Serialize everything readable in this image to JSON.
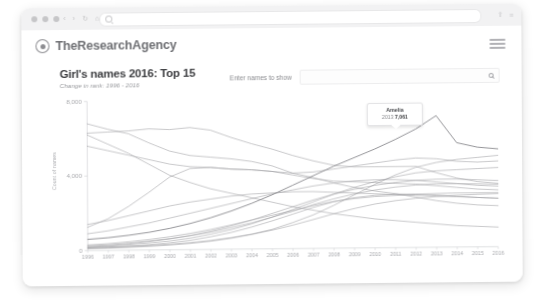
{
  "browser": {
    "traffic_lights": [
      "close",
      "minimize",
      "maximize"
    ],
    "nav": {
      "back": "‹",
      "forward": "›",
      "reload": "↻",
      "home": "⌂"
    },
    "url_value": "",
    "right_icons": [
      "share-icon",
      "menu-icon"
    ]
  },
  "site": {
    "brand_name": "TheResearchAgency",
    "menu_label": "Menu"
  },
  "chart_header": {
    "title": "Girl's names 2016: Top 15",
    "subtitle": "Change in rank: 1996 - 2016"
  },
  "search": {
    "label": "Enter names to show",
    "placeholder": "",
    "value": ""
  },
  "tooltip": {
    "name": "Amelia",
    "year": "2013",
    "value": "7,061"
  },
  "colors": {
    "line": "#9a9b9f",
    "line_highlight": "#7c7d81",
    "axis": "#d3d4d6",
    "tick_text": "#a9aaae",
    "title": "#3e3f42",
    "brand": "#6f7074"
  },
  "chart_data": {
    "type": "line",
    "title": "Girl's names 2016: Top 15",
    "subtitle": "Change in rank: 1996 - 2016",
    "xlabel": "",
    "ylabel": "Count of names",
    "xlim": [
      1996,
      2016
    ],
    "ylim": [
      0,
      8000
    ],
    "yticks": [
      0,
      4000,
      8000
    ],
    "yticklabels": [
      "0",
      "4,000",
      "8,000"
    ],
    "x": [
      1996,
      1997,
      1998,
      1999,
      2000,
      2001,
      2002,
      2003,
      2004,
      2005,
      2006,
      2007,
      2008,
      2009,
      2010,
      2011,
      2012,
      2013,
      2014,
      2015,
      2016
    ],
    "grid": false,
    "legend": "none",
    "annotation": {
      "series": "Amelia",
      "x": 2013,
      "y": 7061,
      "label": "Amelia 2013 7,061"
    },
    "series": [
      {
        "name": "Chloe",
        "values": [
          6800,
          6500,
          6250,
          5750,
          5300,
          5050,
          4950,
          4850,
          4700,
          4450,
          4050,
          3800,
          3500,
          3250,
          3050,
          2900,
          2700,
          2500,
          2350,
          2250,
          2200
        ]
      },
      {
        "name": "Emily",
        "values": [
          6300,
          6350,
          6400,
          6500,
          6450,
          6550,
          6400,
          6000,
          5650,
          5350,
          5000,
          4700,
          4450,
          4350,
          4350,
          4350,
          4350,
          4000,
          3700,
          3500,
          3400
        ]
      },
      {
        "name": "Jessica",
        "values": [
          6200,
          5700,
          5200,
          4600,
          4000,
          3600,
          3250,
          3000,
          2750,
          2500,
          2250,
          2050,
          1850,
          1700,
          1550,
          1450,
          1350,
          1250,
          1150,
          1100,
          1050
        ]
      },
      {
        "name": "Sophie",
        "values": [
          5600,
          5350,
          5100,
          4850,
          4600,
          4450,
          4400,
          4300,
          4250,
          4150,
          3950,
          3750,
          3600,
          3550,
          3500,
          3450,
          3400,
          3300,
          3200,
          3100,
          3050
        ]
      },
      {
        "name": "Olivia",
        "values": [
          1250,
          1700,
          2350,
          3100,
          3900,
          4350,
          4400,
          4300,
          4250,
          4150,
          4050,
          4100,
          4250,
          4400,
          4550,
          4700,
          4800,
          4750,
          4600,
          4550,
          4600
        ]
      },
      {
        "name": "Amelia",
        "values": [
          600,
          680,
          800,
          950,
          1150,
          1400,
          1700,
          2050,
          2450,
          2900,
          3400,
          3900,
          4400,
          4850,
          5300,
          5800,
          6350,
          7061,
          5600,
          5350,
          5250
        ]
      },
      {
        "name": "Isla",
        "values": [
          150,
          170,
          200,
          240,
          300,
          380,
          480,
          620,
          800,
          1050,
          1400,
          1800,
          2300,
          2850,
          3400,
          3900,
          4300,
          4550,
          4700,
          4800,
          4900
        ]
      },
      {
        "name": "Ava",
        "values": [
          180,
          220,
          280,
          360,
          470,
          620,
          820,
          1050,
          1350,
          1700,
          2100,
          2500,
          2900,
          3250,
          3550,
          3800,
          4000,
          4100,
          4150,
          4200,
          4250
        ]
      },
      {
        "name": "Poppy",
        "values": [
          200,
          250,
          330,
          440,
          580,
          760,
          980,
          1250,
          1550,
          1900,
          2250,
          2600,
          2900,
          3150,
          3350,
          3500,
          3600,
          3650,
          3650,
          3600,
          3550
        ]
      },
      {
        "name": "Lily",
        "values": [
          900,
          1050,
          1250,
          1450,
          1700,
          1950,
          2200,
          2450,
          2700,
          2950,
          3150,
          3350,
          3500,
          3600,
          3650,
          3650,
          3600,
          3500,
          3400,
          3300,
          3250
        ]
      },
      {
        "name": "Mia",
        "values": [
          250,
          300,
          380,
          480,
          600,
          750,
          930,
          1150,
          1400,
          1700,
          2000,
          2350,
          2650,
          2900,
          3100,
          3250,
          3350,
          3400,
          3400,
          3380,
          3350
        ]
      },
      {
        "name": "Grace",
        "values": [
          1400,
          1600,
          1850,
          2100,
          2350,
          2550,
          2700,
          2850,
          2950,
          3000,
          3050,
          3050,
          3000,
          2950,
          2900,
          2850,
          2800,
          2750,
          2700,
          2650,
          2600
        ]
      },
      {
        "name": "Ella",
        "values": [
          300,
          360,
          450,
          560,
          700,
          870,
          1070,
          1300,
          1550,
          1800,
          2050,
          2300,
          2500,
          2650,
          2750,
          2800,
          2850,
          2880,
          2900,
          2900,
          2900
        ]
      },
      {
        "name": "Ruby",
        "values": [
          120,
          150,
          200,
          270,
          370,
          500,
          680,
          900,
          1180,
          1500,
          1850,
          2200,
          2500,
          2700,
          2820,
          2870,
          2860,
          2800,
          2720,
          2650,
          2600
        ]
      },
      {
        "name": "Freya",
        "values": [
          100,
          120,
          150,
          190,
          250,
          330,
          440,
          590,
          780,
          1000,
          1260,
          1550,
          1850,
          2120,
          2350,
          2520,
          2640,
          2720,
          2780,
          2820,
          2850
        ]
      }
    ]
  }
}
